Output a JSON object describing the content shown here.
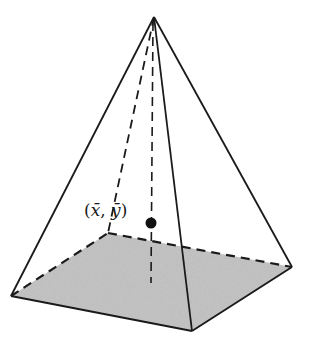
{
  "diagram": {
    "centroid_label": {
      "open": "(",
      "x": "x̄",
      "sep": ", ",
      "y": "ȳ",
      "close": ")"
    },
    "colors": {
      "base_fill": "#c4c4c4",
      "stroke": "#1a1a1a",
      "background": "#ffffff"
    }
  }
}
